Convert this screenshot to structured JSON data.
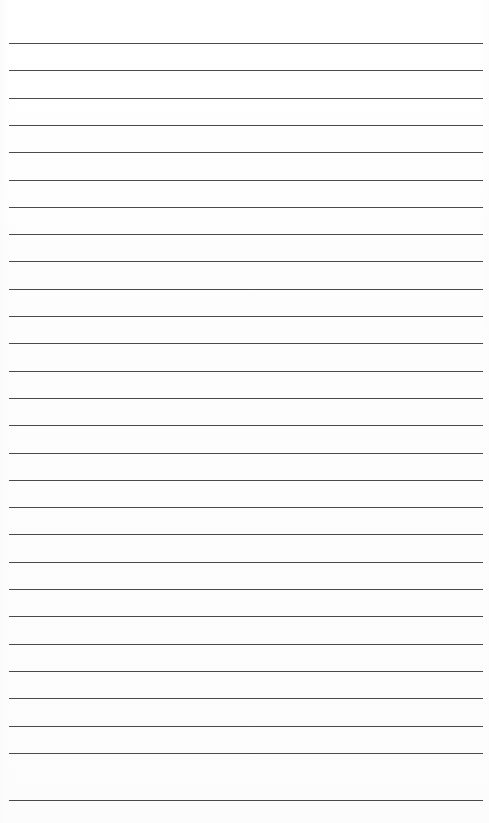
{
  "document": {
    "kind": "ruled-paper-scan",
    "title": "",
    "body_text": "",
    "page_width": 489,
    "page_height": 823,
    "background_color": "#fefefe",
    "paper_tone": "#fdfdfd"
  },
  "ruling": {
    "line_count": 28,
    "line_color": "#4a4a4a",
    "line_thickness_px": 1.2,
    "first_line_y": 43,
    "line_spacing_px": 27.3,
    "left_margin_px": 9,
    "right_margin_px": 6,
    "margin_rule_present": false,
    "header_space_px": 43,
    "footer_space_px": 23,
    "lines": [
      {
        "index": 1,
        "y": 43,
        "x_start": 9,
        "x_end": 483
      },
      {
        "index": 2,
        "y": 70.3,
        "x_start": 9,
        "x_end": 483
      },
      {
        "index": 3,
        "y": 97.6,
        "x_start": 9,
        "x_end": 483
      },
      {
        "index": 4,
        "y": 124.9,
        "x_start": 9,
        "x_end": 483
      },
      {
        "index": 5,
        "y": 152.2,
        "x_start": 9,
        "x_end": 483
      },
      {
        "index": 6,
        "y": 179.5,
        "x_start": 9,
        "x_end": 483
      },
      {
        "index": 7,
        "y": 206.8,
        "x_start": 9,
        "x_end": 483
      },
      {
        "index": 8,
        "y": 234.1,
        "x_start": 9,
        "x_end": 483
      },
      {
        "index": 9,
        "y": 261.4,
        "x_start": 9,
        "x_end": 483
      },
      {
        "index": 10,
        "y": 288.7,
        "x_start": 9,
        "x_end": 483
      },
      {
        "index": 11,
        "y": 316.0,
        "x_start": 9,
        "x_end": 483
      },
      {
        "index": 12,
        "y": 343.3,
        "x_start": 9,
        "x_end": 483
      },
      {
        "index": 13,
        "y": 370.6,
        "x_start": 9,
        "x_end": 483
      },
      {
        "index": 14,
        "y": 397.9,
        "x_start": 9,
        "x_end": 483
      },
      {
        "index": 15,
        "y": 425.2,
        "x_start": 9,
        "x_end": 483
      },
      {
        "index": 16,
        "y": 452.5,
        "x_start": 9,
        "x_end": 483
      },
      {
        "index": 17,
        "y": 479.8,
        "x_start": 9,
        "x_end": 483
      },
      {
        "index": 18,
        "y": 507.1,
        "x_start": 9,
        "x_end": 483
      },
      {
        "index": 19,
        "y": 534.4,
        "x_start": 9,
        "x_end": 483
      },
      {
        "index": 20,
        "y": 561.7,
        "x_start": 9,
        "x_end": 483
      },
      {
        "index": 21,
        "y": 589.0,
        "x_start": 9,
        "x_end": 483
      },
      {
        "index": 22,
        "y": 616.3,
        "x_start": 9,
        "x_end": 483
      },
      {
        "index": 23,
        "y": 643.6,
        "x_start": 9,
        "x_end": 483
      },
      {
        "index": 24,
        "y": 670.9,
        "x_start": 9,
        "x_end": 483
      },
      {
        "index": 25,
        "y": 698.2,
        "x_start": 9,
        "x_end": 483
      },
      {
        "index": 26,
        "y": 725.5,
        "x_start": 9,
        "x_end": 483
      },
      {
        "index": 27,
        "y": 752.8,
        "x_start": 9,
        "x_end": 483
      },
      {
        "index": 28,
        "y": 800.0,
        "x_start": 9,
        "x_end": 483
      }
    ]
  }
}
